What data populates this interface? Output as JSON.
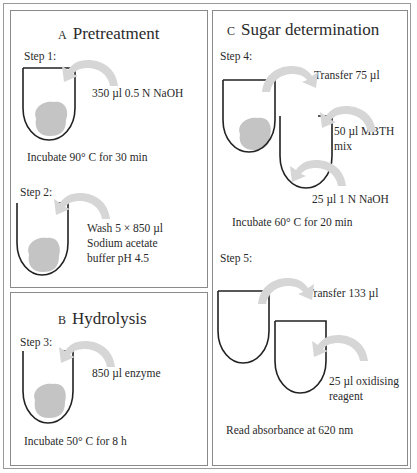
{
  "figure": {
    "panels": [
      {
        "id": "A",
        "letter": "A",
        "title": "Pretreatment",
        "steps": [
          {
            "label": "Step 1:",
            "reagent": "350 µl 0.5 N NaOH",
            "condition": "Incubate 90° C for 30 min"
          },
          {
            "label": "Step 2:",
            "reagent_lines": [
              "Wash 5 × 850 µl",
              "Sodium acetate",
              "buffer pH 4.5"
            ]
          }
        ]
      },
      {
        "id": "B",
        "letter": "B",
        "title": "Hydrolysis",
        "steps": [
          {
            "label": "Step 3:",
            "reagent": "850 µl enzyme",
            "condition": "Incubate 50° C for 8 h"
          }
        ]
      },
      {
        "id": "C",
        "letter": "C",
        "title": "Sugar determination",
        "steps": [
          {
            "label": "Step 4:",
            "transfer": "Transfer 75 µl",
            "reagent_lines": [
              "50 µl MBTH",
              "mix"
            ],
            "reagent2": "25 µl 1 N NaOH",
            "condition": "Incubate 60° C for 20 min"
          },
          {
            "label": "Step 5:",
            "transfer": "Transfer 133 µl",
            "reagent_lines": [
              "25 µl oxidising",
              "reagent"
            ],
            "condition": "Read absorbance at 620 nm"
          }
        ]
      }
    ],
    "colors": {
      "tube_stroke": "#222222",
      "pellet": "#c4c4c4",
      "arrow": "#d6d6d6",
      "border": "#8a8a8a"
    }
  }
}
